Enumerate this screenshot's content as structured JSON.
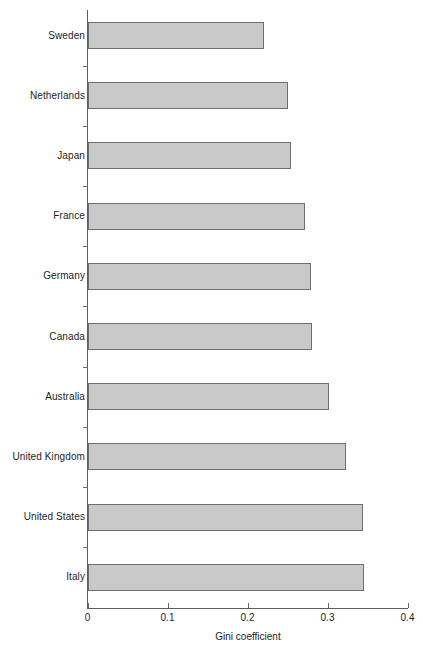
{
  "chart_data": {
    "type": "bar",
    "orientation": "horizontal",
    "title": "",
    "xlabel": "Gini coefficient",
    "ylabel": "",
    "xlim": [
      0,
      0.4
    ],
    "xticks": [
      "0",
      "0.1",
      "0.2",
      "0.3",
      "0.4"
    ],
    "xtick_values": [
      0,
      0.1,
      0.2,
      0.3,
      0.4
    ],
    "grid": false,
    "legend": false,
    "bar_fill_color": "#c9c9c9",
    "bar_edge_color": "#6e6e6e",
    "axis_color": "#5d5d5d",
    "categories": [
      "Sweden",
      "Netherlands",
      "Japan",
      "France",
      "Germany",
      "Canada",
      "Australia",
      "United Kingdom",
      "United States",
      "Italy"
    ],
    "values": [
      0.221,
      0.25,
      0.254,
      0.272,
      0.279,
      0.281,
      0.302,
      0.323,
      0.344,
      0.345
    ]
  }
}
